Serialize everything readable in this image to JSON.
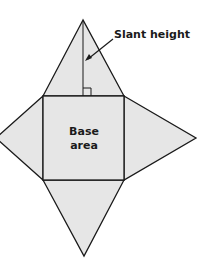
{
  "diagram": {
    "type": "square pyramid net",
    "colors": {
      "fill": "#e6e6e6",
      "stroke": "#1a1a1a",
      "background": "#ffffff"
    },
    "labels": {
      "slant_height": "Slant height",
      "base_line1": "Base",
      "base_line2": "area"
    },
    "shapes": [
      "base square",
      "top triangular face",
      "left triangular face",
      "right triangular face",
      "bottom triangular face"
    ],
    "annotations": [
      "slant height segment",
      "right angle marker",
      "arrow pointing to slant height"
    ]
  }
}
